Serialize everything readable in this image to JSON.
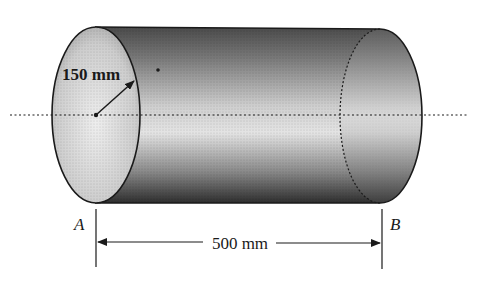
{
  "figure": {
    "type": "cylinder-dimension-diagram",
    "radius_label": "150 mm",
    "length_label": "500 mm",
    "end_left_label": "A",
    "end_right_label": "B"
  },
  "colors": {
    "ink": "#1a1a1a",
    "shade_dark": "#3a3a3a",
    "shade_light": "#e6e6e6",
    "background": "#ffffff"
  }
}
